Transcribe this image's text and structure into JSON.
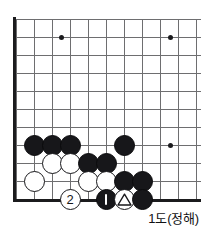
{
  "diagram": {
    "caption": "1도(정해)",
    "board": {
      "line_color": "#6e6e70",
      "edge_color": "#1b1b1d",
      "background": "#ffffff",
      "cell_size": 18,
      "origin_x": 16,
      "origin_y": 19,
      "cols": 11,
      "rows": 11,
      "x_positions": [
        16,
        34,
        52,
        70,
        88,
        106,
        124,
        142,
        160,
        178,
        196
      ],
      "y_positions": [
        19,
        37,
        55,
        73,
        91,
        109,
        127,
        145,
        163,
        181,
        199
      ]
    },
    "star_points": [
      {
        "name": "star-point-upper-left",
        "cx": 61,
        "cy": 37
      },
      {
        "name": "star-point-upper-right",
        "cx": 170,
        "cy": 37
      },
      {
        "name": "star-point-lower-right",
        "cx": 170,
        "cy": 145
      }
    ],
    "stones": [
      {
        "id": "b1",
        "color": "black",
        "cx": 34,
        "cy": 145,
        "mark": "none"
      },
      {
        "id": "b2",
        "color": "black",
        "cx": 52,
        "cy": 145,
        "mark": "none"
      },
      {
        "id": "b3",
        "color": "black",
        "cx": 70,
        "cy": 145,
        "mark": "none"
      },
      {
        "id": "b4",
        "color": "black",
        "cx": 124,
        "cy": 145,
        "mark": "none"
      },
      {
        "id": "w1",
        "color": "white",
        "cx": 52,
        "cy": 163,
        "mark": "none"
      },
      {
        "id": "w2",
        "color": "white",
        "cx": 70,
        "cy": 163,
        "mark": "none"
      },
      {
        "id": "b5",
        "color": "black",
        "cx": 88,
        "cy": 163,
        "mark": "none"
      },
      {
        "id": "b6",
        "color": "black",
        "cx": 106,
        "cy": 163,
        "mark": "none"
      },
      {
        "id": "w3",
        "color": "white",
        "cx": 34,
        "cy": 181,
        "mark": "none"
      },
      {
        "id": "w4",
        "color": "white",
        "cx": 88,
        "cy": 181,
        "mark": "none"
      },
      {
        "id": "w5",
        "color": "white",
        "cx": 106,
        "cy": 181,
        "mark": "none"
      },
      {
        "id": "b7",
        "color": "black",
        "cx": 124,
        "cy": 181,
        "mark": "none"
      },
      {
        "id": "b8",
        "color": "black",
        "cx": 142,
        "cy": 181,
        "mark": "none"
      },
      {
        "id": "w6",
        "color": "white",
        "cx": 70,
        "cy": 199,
        "mark": "number",
        "label": "2"
      },
      {
        "id": "b9",
        "color": "black",
        "cx": 106,
        "cy": 199,
        "mark": "number",
        "label": "1"
      },
      {
        "id": "w7",
        "color": "white",
        "cx": 124,
        "cy": 199,
        "mark": "triangle"
      },
      {
        "id": "b10",
        "color": "black",
        "cx": 142,
        "cy": 199,
        "mark": "none"
      }
    ]
  }
}
